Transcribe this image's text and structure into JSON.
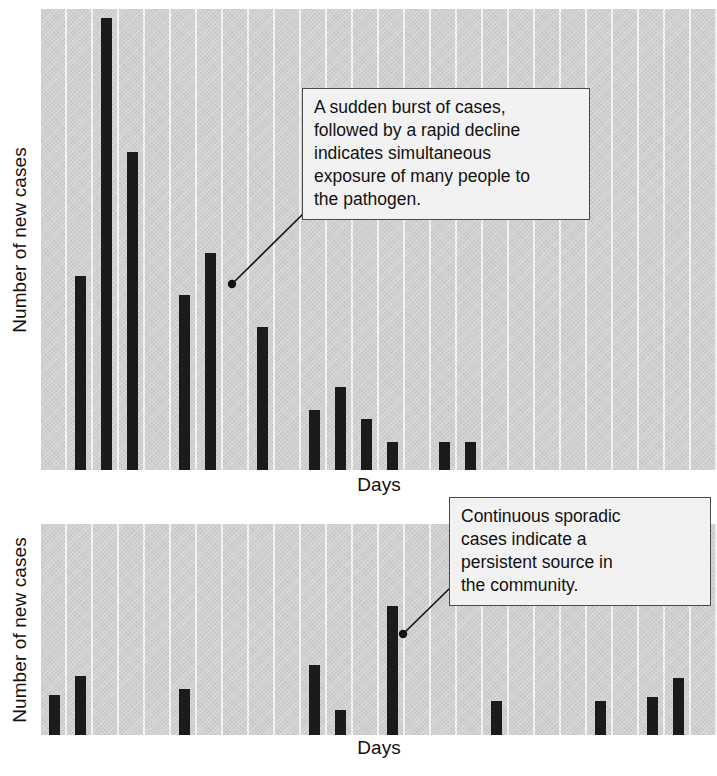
{
  "figure": {
    "background": "#ffffff",
    "bar_color": "#1b1b1b",
    "plot_background": "#cfcfcf",
    "stripe_color": "#f3f3f3",
    "callout_background": "#f2f2f2",
    "callout_border": "#4a4a4a"
  },
  "panels": [
    {
      "id": "point-source-outbreak",
      "ylabel": "Number of new cases",
      "xlabel": "Days",
      "callout": "A sudden burst of cases,\nfollowed by a rapid decline\nindicates simultaneous\nexposure of many people to\nthe pathogen."
    },
    {
      "id": "continuous-source-outbreak",
      "ylabel": "Number of new cases",
      "xlabel": "Days",
      "callout": "Continuous sporadic\ncases indicate a\npersistent source in\nthe community."
    }
  ],
  "chart_data": [
    {
      "type": "bar",
      "title": "Point-source outbreak",
      "xlabel": "Days",
      "ylabel": "Number of new cases",
      "grid": "vertical stripes, no numeric ticks",
      "legend": "none",
      "xlim": [
        0,
        26
      ],
      "ylim": [
        0,
        100
      ],
      "categories": [
        1,
        2,
        3,
        4,
        5,
        6,
        7,
        8,
        9,
        10,
        11,
        12,
        13,
        14,
        15,
        16,
        17,
        18,
        19,
        20,
        21,
        22,
        23,
        24,
        25,
        26
      ],
      "values": [
        0,
        42,
        98,
        69,
        0,
        38,
        47,
        0,
        31,
        0,
        13,
        18,
        11,
        6,
        0,
        6,
        6,
        0,
        0,
        0,
        0,
        0,
        0,
        0,
        0,
        0
      ],
      "annotations": [
        {
          "text": "A sudden burst of cases, followed by a rapid decline indicates simultaneous exposure of many people to the pathogen.",
          "anchor_day": 10
        }
      ]
    },
    {
      "type": "bar",
      "title": "Continuous-source outbreak",
      "xlabel": "Days",
      "ylabel": "Number of new cases",
      "grid": "vertical stripes, no numeric ticks",
      "legend": "none",
      "xlim": [
        0,
        26
      ],
      "ylim": [
        0,
        100
      ],
      "categories": [
        1,
        2,
        3,
        4,
        5,
        6,
        7,
        8,
        9,
        10,
        11,
        12,
        13,
        14,
        15,
        16,
        17,
        18,
        19,
        20,
        21,
        22,
        23,
        24,
        25,
        26
      ],
      "values": [
        19,
        28,
        0,
        0,
        0,
        22,
        0,
        0,
        0,
        0,
        33,
        12,
        0,
        61,
        0,
        0,
        0,
        16,
        0,
        0,
        0,
        16,
        0,
        18,
        27,
        0
      ],
      "annotations": [
        {
          "text": "Continuous sporadic cases indicate a persistent source in the community.",
          "anchor_day": 16
        }
      ]
    }
  ]
}
